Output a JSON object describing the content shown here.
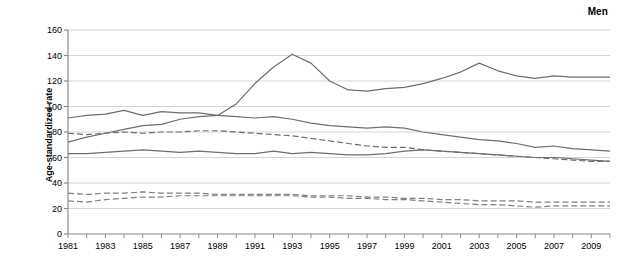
{
  "panel": {
    "title": "Men"
  },
  "chart_data": {
    "type": "line",
    "title": "Men",
    "xlabel": "",
    "ylabel": "Age-standardized rate",
    "xlim": [
      1981,
      2010
    ],
    "ylim": [
      0,
      160
    ],
    "yticks": [
      0,
      20,
      40,
      60,
      80,
      100,
      120,
      140,
      160
    ],
    "ytick_labels": [
      "0",
      "20",
      "40",
      "60",
      "80",
      "100",
      "120",
      "140",
      "160"
    ],
    "xticks": [
      1981,
      1982,
      1983,
      1984,
      1985,
      1986,
      1987,
      1988,
      1989,
      1990,
      1991,
      1992,
      1993,
      1994,
      1995,
      1996,
      1997,
      1998,
      1999,
      2000,
      2001,
      2002,
      2003,
      2004,
      2005,
      2006,
      2007,
      2008,
      2009,
      2010
    ],
    "xtick_labels_shown": [
      "1981",
      "1983",
      "1985",
      "1987",
      "1989",
      "1991",
      "1993",
      "1995",
      "1997",
      "1999",
      "2001",
      "2003",
      "2005",
      "2007",
      "2009"
    ],
    "grid": "horizontal",
    "legend": "none",
    "x": [
      1981,
      1982,
      1983,
      1984,
      1985,
      1986,
      1987,
      1988,
      1989,
      1990,
      1991,
      1992,
      1993,
      1994,
      1995,
      1996,
      1997,
      1998,
      1999,
      2000,
      2001,
      2002,
      2003,
      2004,
      2005,
      2006,
      2007,
      2008,
      2009,
      2010
    ],
    "series": [
      {
        "name": "series-1-solid-peaked",
        "style": "solid",
        "color": "#6e6e6e",
        "values": [
          72,
          76,
          79,
          82,
          85,
          86,
          90,
          92,
          93,
          102,
          118,
          131,
          141,
          134,
          120,
          113,
          112,
          114,
          115,
          118,
          122,
          127,
          134,
          128,
          124,
          122,
          124,
          123,
          123,
          123
        ]
      },
      {
        "name": "series-2-solid-upper",
        "style": "solid",
        "color": "#6e6e6e",
        "values": [
          91,
          93,
          94,
          97,
          93,
          96,
          95,
          95,
          93,
          92,
          91,
          92,
          90,
          87,
          85,
          84,
          83,
          84,
          83,
          80,
          78,
          76,
          74,
          73,
          71,
          68,
          69,
          67,
          66,
          65
        ]
      },
      {
        "name": "series-3-dashed-upper",
        "style": "dashed",
        "color": "#6e6e6e",
        "values": [
          79,
          78,
          79,
          80,
          79,
          80,
          80,
          81,
          81,
          80,
          79,
          78,
          77,
          75,
          73,
          71,
          69,
          68,
          68,
          66,
          65,
          64,
          63,
          62,
          61,
          60,
          59,
          58,
          57,
          57
        ]
      },
      {
        "name": "series-4-solid-lower",
        "style": "solid",
        "color": "#6e6e6e",
        "values": [
          63,
          63,
          64,
          65,
          66,
          65,
          64,
          65,
          64,
          63,
          63,
          65,
          63,
          64,
          63,
          62,
          62,
          63,
          65,
          66,
          65,
          64,
          63,
          62,
          61,
          60,
          60,
          59,
          58,
          57
        ]
      },
      {
        "name": "series-5-dashed-lower-a",
        "style": "dashed",
        "color": "#808080",
        "values": [
          32,
          31,
          32,
          32,
          33,
          32,
          32,
          32,
          31,
          31,
          31,
          31,
          31,
          30,
          30,
          30,
          29,
          29,
          28,
          28,
          27,
          27,
          26,
          26,
          26,
          25,
          25,
          25,
          25,
          25
        ]
      },
      {
        "name": "series-6-dashed-lower-b",
        "style": "dashed",
        "color": "#808080",
        "values": [
          26,
          25,
          27,
          28,
          29,
          29,
          30,
          30,
          30,
          30,
          30,
          30,
          30,
          29,
          29,
          28,
          28,
          27,
          27,
          26,
          25,
          24,
          23,
          23,
          22,
          21,
          22,
          22,
          22,
          22
        ]
      }
    ]
  }
}
